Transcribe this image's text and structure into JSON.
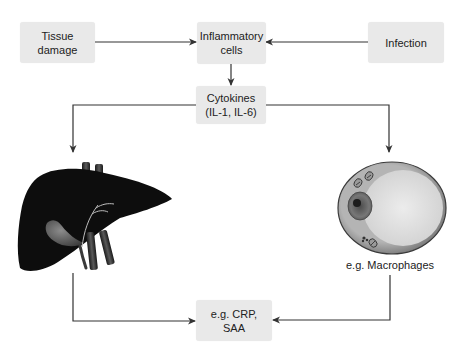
{
  "diagram": {
    "type": "flowchart",
    "title": "",
    "nodes": {
      "tissue_damage": {
        "label": "Tissue\ndamage"
      },
      "inflammatory_cells": {
        "label": "Inflammatory\ncells"
      },
      "infection": {
        "label": "Infection"
      },
      "cytokines": {
        "label": "Cytokines\n(IL-1, IL-6)"
      },
      "liver": {
        "label": "",
        "icon": "liver-icon"
      },
      "macrophage": {
        "label": "e.g. Macrophages",
        "icon": "macrophage-cell-icon"
      },
      "acute_phase_proteins": {
        "label": "e.g. CRP,\nSAA"
      }
    },
    "edges": [
      {
        "from": "tissue_damage",
        "to": "inflammatory_cells"
      },
      {
        "from": "infection",
        "to": "inflammatory_cells"
      },
      {
        "from": "inflammatory_cells",
        "to": "cytokines"
      },
      {
        "from": "cytokines",
        "to": "liver"
      },
      {
        "from": "cytokines",
        "to": "macrophage"
      },
      {
        "from": "liver",
        "to": "acute_phase_proteins"
      },
      {
        "from": "macrophage",
        "to": "acute_phase_proteins"
      }
    ],
    "colors": {
      "box_fill": "#e9e9e9",
      "line": "#333333",
      "liver": "#0d0d0d",
      "cell_outer": "#8a8a8a",
      "cell_inner": "#dcdcdc"
    }
  }
}
